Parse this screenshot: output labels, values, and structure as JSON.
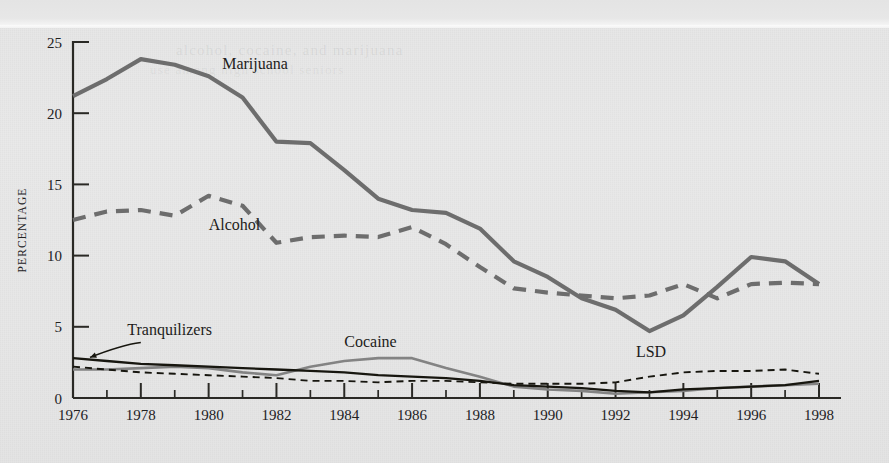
{
  "figure": {
    "background_color": "#e7e7e7",
    "ghost_text_line1": "alcohol, cocaine, and marijuana",
    "ghost_text_line2": "use among high school seniors"
  },
  "chart_data": {
    "type": "line",
    "title": "",
    "xlabel": "",
    "ylabel": "PERCENTAGE",
    "xlim": [
      1976,
      1998
    ],
    "ylim": [
      0,
      25
    ],
    "yticks": [
      0,
      5,
      10,
      15,
      20,
      25
    ],
    "ytick_labels": [
      "0",
      "5",
      "10",
      "15",
      "20",
      "25"
    ],
    "xticks": [
      1976,
      1978,
      1980,
      1982,
      1984,
      1986,
      1988,
      1990,
      1992,
      1994,
      1996,
      1998
    ],
    "xtick_labels": [
      "1976",
      "1978",
      "1980",
      "1982",
      "1984",
      "1986",
      "1988",
      "1990",
      "1992",
      "1994",
      "1996",
      "1998"
    ],
    "minor_xticks": [
      1977,
      1979,
      1981,
      1983,
      1985,
      1987,
      1989,
      1991,
      1993,
      1995,
      1997
    ],
    "grid": false,
    "legend_position": "inline-labels",
    "x": [
      1976,
      1977,
      1978,
      1979,
      1980,
      1981,
      1982,
      1983,
      1984,
      1985,
      1986,
      1987,
      1988,
      1989,
      1990,
      1991,
      1992,
      1993,
      1994,
      1995,
      1996,
      1997,
      1998
    ],
    "series": [
      {
        "name": "Marijuana",
        "color": "#6d6d6d",
        "style": "solid",
        "width": 4.2,
        "label_x": 1980.4,
        "label_y": 23.1,
        "values": [
          21.2,
          22.4,
          23.8,
          23.4,
          22.6,
          21.1,
          18.0,
          17.9,
          16.0,
          14.0,
          13.2,
          13.0,
          11.9,
          9.6,
          8.5,
          7.0,
          6.2,
          4.7,
          5.8,
          7.8,
          9.9,
          9.6,
          8.0
        ]
      },
      {
        "name": "Alcohol",
        "color": "#6d6d6d",
        "style": "dashed",
        "width": 4.2,
        "label_x": 1980.0,
        "label_y": 11.8,
        "values": [
          12.5,
          13.1,
          13.2,
          12.8,
          14.2,
          13.5,
          10.9,
          11.3,
          11.4,
          11.3,
          12.0,
          10.8,
          9.2,
          7.7,
          7.4,
          7.2,
          7.0,
          7.2,
          8.0,
          7.0,
          8.0,
          8.1,
          8.0
        ]
      },
      {
        "name": "Cocaine",
        "color": "#838383",
        "style": "solid",
        "width": 2.6,
        "label_x": 1984.0,
        "label_y": 3.6,
        "values": [
          2.0,
          2.0,
          2.1,
          2.2,
          2.1,
          1.8,
          1.6,
          2.2,
          2.6,
          2.8,
          2.8,
          2.1,
          1.5,
          0.8,
          0.6,
          0.5,
          0.3,
          0.4,
          0.5,
          0.7,
          0.8,
          0.9,
          1.0
        ]
      },
      {
        "name": "Tranquilizers",
        "color": "#17160f",
        "style": "solid",
        "width": 2.3,
        "label_x": 1977.6,
        "label_y": 4.4,
        "values": [
          2.8,
          2.6,
          2.4,
          2.3,
          2.2,
          2.1,
          2.0,
          1.9,
          1.8,
          1.6,
          1.5,
          1.4,
          1.2,
          0.9,
          0.8,
          0.7,
          0.5,
          0.4,
          0.6,
          0.7,
          0.8,
          0.9,
          1.2
        ]
      },
      {
        "name": "LSD",
        "color": "#17160f",
        "style": "dashed",
        "width": 1.9,
        "label_x": 1992.6,
        "label_y": 2.9,
        "values": [
          2.2,
          2.0,
          1.8,
          1.7,
          1.6,
          1.5,
          1.4,
          1.2,
          1.2,
          1.1,
          1.2,
          1.2,
          1.1,
          1.0,
          1.0,
          1.0,
          1.1,
          1.5,
          1.8,
          1.9,
          1.9,
          2.0,
          1.7
        ]
      }
    ],
    "annotations": [
      {
        "name": "tranquilizers-leader",
        "from_x": 1978.0,
        "from_y": 3.9,
        "to_x": 1976.5,
        "to_y": 2.85
      }
    ]
  }
}
